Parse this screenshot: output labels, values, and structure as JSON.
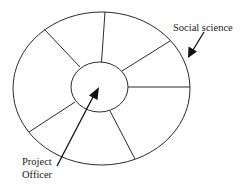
{
  "diagram": {
    "type": "concentric-wheel",
    "outer_ellipse": {
      "cx": 101.5,
      "cy": 88.5,
      "rx": 88.5,
      "ry": 76.5
    },
    "inner_circle": {
      "cx": 99.5,
      "cy": 87,
      "rx": 28.5,
      "ry": 25
    },
    "segments": 7,
    "spokes": [
      {
        "x1": 101.5,
        "y1": 62,
        "x2": 105,
        "y2": 12
      },
      {
        "x1": 122,
        "y1": 71,
        "x2": 170,
        "y2": 41
      },
      {
        "x1": 128,
        "y1": 87,
        "x2": 190,
        "y2": 87
      },
      {
        "x1": 110,
        "y1": 111,
        "x2": 135,
        "y2": 159
      },
      {
        "x1": 75,
        "y1": 102,
        "x2": 29,
        "y2": 132
      },
      {
        "x1": 80,
        "y1": 67,
        "x2": 44,
        "y2": 29
      }
    ],
    "labels": {
      "social_science": "Social science",
      "project_officer_line1": "Project",
      "project_officer_line2": "Officer"
    },
    "arrows": {
      "social_science": {
        "from": [
          204,
          32
        ],
        "to": [
          188,
          58
        ]
      },
      "project_officer": {
        "from": [
          57,
          166
        ],
        "to": [
          99,
          87
        ]
      }
    },
    "stroke_color": "#2a2a2a",
    "background_color": "#ffffff"
  }
}
